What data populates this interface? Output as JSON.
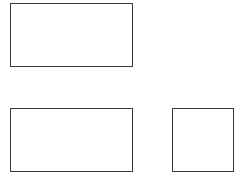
{
  "canvas": {
    "width": 241,
    "height": 178,
    "background": "#ffffff"
  },
  "stroke_color": "#3a3a3a",
  "boxes": [
    {
      "id": "box-top-left",
      "x": 10,
      "y": 3,
      "width": 123,
      "height": 64,
      "label": ""
    },
    {
      "id": "box-bottom-left",
      "x": 10,
      "y": 108,
      "width": 123,
      "height": 64,
      "label": ""
    },
    {
      "id": "box-bottom-right",
      "x": 172,
      "y": 108,
      "width": 62,
      "height": 64,
      "label": ""
    }
  ]
}
